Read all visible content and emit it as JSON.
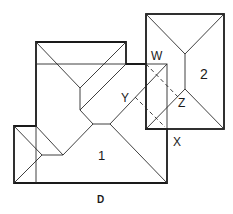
{
  "diagram": {
    "type": "roof-plan",
    "caption": "D",
    "regions": [
      {
        "id": "roof-1",
        "label": "1"
      },
      {
        "id": "roof-2",
        "label": "2"
      }
    ],
    "points": [
      {
        "id": "W",
        "label": "W"
      },
      {
        "id": "X",
        "label": "X"
      },
      {
        "id": "Y",
        "label": "Y"
      },
      {
        "id": "Z",
        "label": "Z"
      }
    ],
    "colors": {
      "line": "#1a1a1a",
      "background": "#ffffff"
    }
  }
}
